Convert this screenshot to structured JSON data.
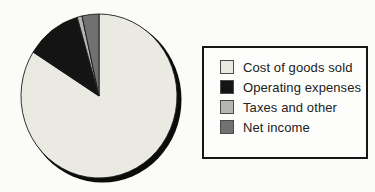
{
  "chart_data": {
    "type": "pie",
    "categories": [
      "Cost of goods sold",
      "Operating expenses",
      "Taxes and other",
      "Net income"
    ],
    "values": [
      84,
      11.5,
      1,
      3.5
    ],
    "unit": "percent_of_revenue",
    "start_angle_deg": 0,
    "direction": "clockwise",
    "colors": [
      "#eaeae2",
      "#141414",
      "#b5b5b1",
      "#717171"
    ],
    "slice_outline_color": "#1a1a1a",
    "shadow_color": "#0b0b0b",
    "legend_position": "right",
    "legend_border_color": "#161616"
  }
}
